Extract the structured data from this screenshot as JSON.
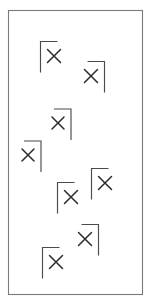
{
  "figure": {
    "background_color": "#ffffff",
    "border_color": "#7a7a7a",
    "bracket_color": "#4a4a52",
    "cross_color": "#2a2a2e",
    "width": 150,
    "height": 303,
    "marker_count": 8
  },
  "frame": {
    "x": 8,
    "y": 10,
    "width": 134,
    "height": 284
  },
  "chart_data": {
    "type": "scatter",
    "xlabel": "",
    "ylabel": "",
    "xlim": [
      8,
      142
    ],
    "ylim": [
      10,
      294
    ],
    "grid": false,
    "legend": null,
    "categories": [],
    "values": [],
    "series": [
      {
        "name": "markers",
        "points": [
          {
            "id": "marker-1",
            "x": 54,
            "y": 56,
            "bracket": "top-left",
            "cross_size": 13
          },
          {
            "id": "marker-2",
            "x": 91,
            "y": 76,
            "bracket": "top-right",
            "cross_size": 13
          },
          {
            "id": "marker-3",
            "x": 58,
            "y": 123,
            "bracket": "top-right",
            "cross_size": 12
          },
          {
            "id": "marker-4",
            "x": 28,
            "y": 155,
            "bracket": "top-right",
            "cross_size": 12
          },
          {
            "id": "marker-5",
            "x": 105,
            "y": 183,
            "bracket": "top-left",
            "cross_size": 13
          },
          {
            "id": "marker-6",
            "x": 71,
            "y": 197,
            "bracket": "top-left",
            "cross_size": 13
          },
          {
            "id": "marker-7",
            "x": 85,
            "y": 239,
            "bracket": "top-right",
            "cross_size": 13
          },
          {
            "id": "marker-8",
            "x": 56,
            "y": 262,
            "bracket": "top-left",
            "cross_size": 13
          }
        ]
      }
    ]
  }
}
